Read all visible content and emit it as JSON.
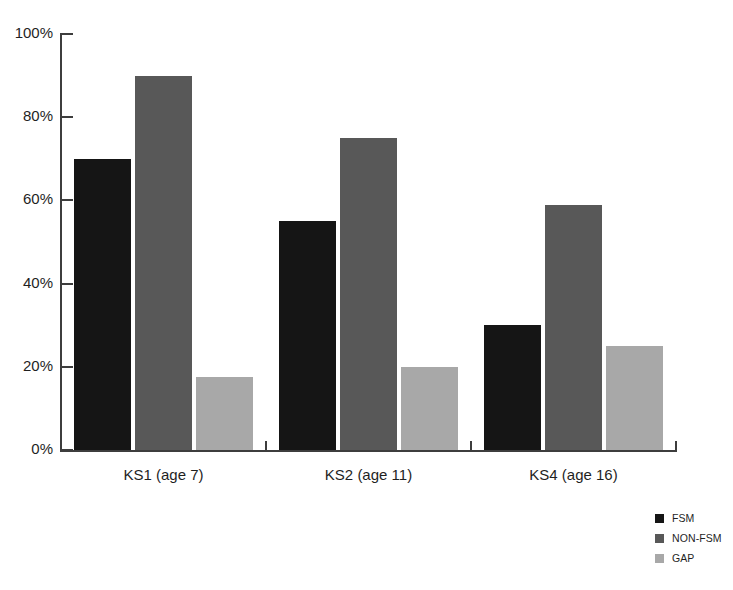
{
  "chart_data": {
    "type": "bar",
    "title": "",
    "subtitle": "",
    "xlabel": "",
    "ylabel": "",
    "categories": [
      "KS1 (age 7)",
      "KS2 (age 11)",
      "KS4 (age 16)"
    ],
    "series": [
      {
        "name": "FSM",
        "color": "#151515",
        "values": [
          70,
          55,
          30
        ]
      },
      {
        "name": "NON-FSM",
        "color": "#585858",
        "values": [
          90,
          75,
          59
        ]
      },
      {
        "name": "GAP",
        "color": "#a8a8a8",
        "values": [
          17.5,
          20,
          25
        ]
      }
    ],
    "ylim": [
      0,
      100
    ],
    "yticks": [
      0,
      20,
      40,
      60,
      80,
      100
    ],
    "ytick_labels": [
      "0%",
      "20%",
      "40%",
      "60%",
      "80%",
      "100%"
    ],
    "grid": false,
    "legend_position": "bottom-right",
    "legend_entries": [
      {
        "label": "FSM",
        "color": "#151515"
      },
      {
        "label": "NON-FSM",
        "color": "#585858"
      },
      {
        "label": "GAP",
        "color": "#a8a8a8"
      }
    ],
    "axis_color": "#3d3d3d",
    "background_color": "#ffffff"
  }
}
